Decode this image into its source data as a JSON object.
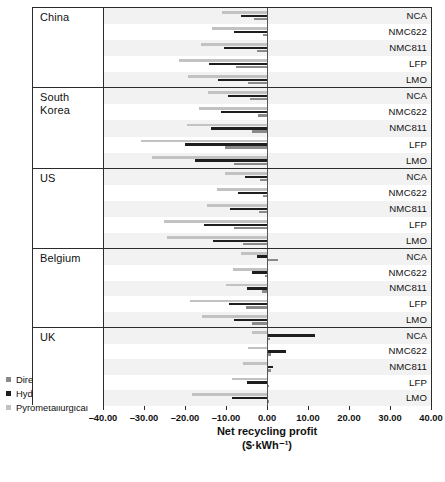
{
  "chart_data": {
    "type": "bar",
    "orientation": "horizontal",
    "title": "",
    "xlabel": "Net recycling profit",
    "xunit": "($·kWh⁻¹)",
    "ylabel": "",
    "xlim": [
      -40,
      40
    ],
    "xticks": [
      -40,
      -30,
      -20,
      -10,
      0,
      10,
      20,
      30,
      40
    ],
    "xtick_labels": [
      "–40.00",
      "–30.00",
      "–20.00",
      "–10.00",
      "0.00",
      "10.00",
      "20.00",
      "30.00",
      "40.00"
    ],
    "grid": false,
    "legend_position": "lower-left-outside",
    "series_names": [
      "Direct",
      "Hydrometallurgical",
      "Pyrometallurgical"
    ],
    "series_colors": [
      "#8a8a8a",
      "#1e1e1e",
      "#c2c2c2"
    ],
    "categories": [
      "NCA",
      "NMC622",
      "NMC811",
      "LFP",
      "LMO"
    ],
    "groups": [
      "China",
      "South Korea",
      "US",
      "Belgium",
      "UK"
    ],
    "panels": [
      {
        "group": "China",
        "rows": [
          {
            "category": "NCA",
            "Direct": -3.2,
            "Hydrometallurgical": -6.4,
            "Pyrometallurgical": -11.0
          },
          {
            "category": "NMC622",
            "Direct": -1.0,
            "Hydrometallurgical": -8.2,
            "Pyrometallurgical": -13.5
          },
          {
            "category": "NMC811",
            "Direct": -2.4,
            "Hydrometallurgical": -10.6,
            "Pyrometallurgical": -16.2
          },
          {
            "category": "LFP",
            "Direct": -7.6,
            "Hydrometallurgical": -14.2,
            "Pyrometallurgical": -21.6
          },
          {
            "category": "LMO",
            "Direct": -4.6,
            "Hydrometallurgical": -12.0,
            "Pyrometallurgical": -19.4
          }
        ]
      },
      {
        "group": "South Korea",
        "rows": [
          {
            "category": "NCA",
            "Direct": -4.2,
            "Hydrometallurgical": -9.6,
            "Pyrometallurgical": -14.6
          },
          {
            "category": "NMC622",
            "Direct": -2.2,
            "Hydrometallurgical": -11.4,
            "Pyrometallurgical": -16.8
          },
          {
            "category": "NMC811",
            "Direct": -3.6,
            "Hydrometallurgical": -13.8,
            "Pyrometallurgical": -19.6
          },
          {
            "category": "LFP",
            "Direct": -10.4,
            "Hydrometallurgical": -20.2,
            "Pyrometallurgical": -30.8
          },
          {
            "category": "LMO",
            "Direct": -8.0,
            "Hydrometallurgical": -17.6,
            "Pyrometallurgical": -28.2
          }
        ]
      },
      {
        "group": "US",
        "rows": [
          {
            "category": "NCA",
            "Direct": -1.8,
            "Hydrometallurgical": -5.4,
            "Pyrometallurgical": -10.4
          },
          {
            "category": "NMC622",
            "Direct": -0.9,
            "Hydrometallurgical": -7.2,
            "Pyrometallurgical": -12.2
          },
          {
            "category": "NMC811",
            "Direct": -2.0,
            "Hydrometallurgical": -9.0,
            "Pyrometallurgical": -14.8
          },
          {
            "category": "LFP",
            "Direct": -8.2,
            "Hydrometallurgical": -15.4,
            "Pyrometallurgical": -25.2
          },
          {
            "category": "LMO",
            "Direct": -6.0,
            "Hydrometallurgical": -13.2,
            "Pyrometallurgical": -24.6
          }
        ]
      },
      {
        "group": "Belgium",
        "rows": [
          {
            "category": "NCA",
            "Direct": 2.8,
            "Hydrometallurgical": -2.4,
            "Pyrometallurgical": -6.4
          },
          {
            "category": "NMC622",
            "Direct": -0.6,
            "Hydrometallurgical": -3.6,
            "Pyrometallurgical": -8.4
          },
          {
            "category": "NMC811",
            "Direct": -1.2,
            "Hydrometallurgical": -5.0,
            "Pyrometallurgical": -10.0
          },
          {
            "category": "LFP",
            "Direct": -5.2,
            "Hydrometallurgical": -9.4,
            "Pyrometallurgical": -18.8
          },
          {
            "category": "LMO",
            "Direct": -3.8,
            "Hydrometallurgical": -8.2,
            "Pyrometallurgical": -16.0
          }
        ]
      },
      {
        "group": "UK",
        "rows": [
          {
            "category": "NCA",
            "Direct": 0.7,
            "Hydrometallurgical": 11.8,
            "Pyrometallurgical": -3.6
          },
          {
            "category": "NMC622",
            "Direct": 1.0,
            "Hydrometallurgical": 4.6,
            "Pyrometallurgical": -4.6
          },
          {
            "category": "NMC811",
            "Direct": 1.0,
            "Hydrometallurgical": 1.4,
            "Pyrometallurgical": -6.0
          },
          {
            "category": "LFP",
            "Direct": 0.5,
            "Hydrometallurgical": -4.8,
            "Pyrometallurgical": -8.6
          },
          {
            "category": "LMO",
            "Direct": 0.4,
            "Hydrometallurgical": -8.6,
            "Pyrometallurgical": -18.4
          }
        ]
      }
    ]
  },
  "legend": {
    "items": [
      {
        "label": "Direct",
        "color": "#8a8a8a",
        "key": "direct"
      },
      {
        "label": "Hydrometallurgical",
        "color": "#1e1e1e",
        "key": "hydro"
      },
      {
        "label": "Pyrometallurgical",
        "color": "#c2c2c2",
        "key": "pyro"
      }
    ]
  },
  "axis": {
    "title": "Net recycling profit",
    "unit": "($·kWh⁻¹)"
  }
}
